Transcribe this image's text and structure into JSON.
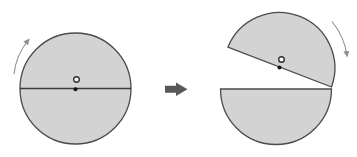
{
  "colors": {
    "background": "#ffffff",
    "disk_fill": "#d3d3d3",
    "disk_outline": "#4b4b4b",
    "axis_line": "#3a3a3a",
    "center_dot": "#111111",
    "ring_stroke": "#2f2f2f",
    "ring_fill": "#ffffff",
    "rotation_arrow": "#8f8f8f",
    "transform_arrow": "#57585a"
  },
  "left_panel": {
    "name": "solid-disk",
    "rotation_direction": "clockwise",
    "disk": {
      "cx": 75.5,
      "cy": 88.5,
      "r": 55.5
    },
    "diameter_line": {
      "x1": 20,
      "y1": 88.5,
      "x2": 131,
      "y2": 88.5
    },
    "ring": {
      "cx": 76.5,
      "cy": 79.5,
      "r": 2.8
    },
    "dot": {
      "cx": 75.5,
      "cy": 89.3,
      "r": 2
    },
    "rotation_arrow_path": "M 14 74 A 64 64 0 0 1 28.5 40"
  },
  "transform_arrow": {
    "direction": "right",
    "points": "165,85.8 176,85.8 176,82.5 187.5,89.3 176,96.1 176,92.8 165,92.8"
  },
  "right_panel": {
    "name": "split-disk",
    "rotation_direction": "clockwise",
    "split_angle_deg": 21,
    "bottom_half_path": "M 220.5 89 A 55.5 55.5 0 0 0 331.5 89 Z",
    "top_half_path": "M 227.9 47.2 A 55.5 55.5 0 0 1 331.5 87 Z",
    "ring": {
      "cx": 281.5,
      "cy": 59.5,
      "r": 2.8
    },
    "dot": {
      "cx": 279.5,
      "cy": 67.4,
      "r": 2
    },
    "rotation_arrow_path": "M 332 21.5 A 68 68 0 0 1 347 55.5"
  }
}
